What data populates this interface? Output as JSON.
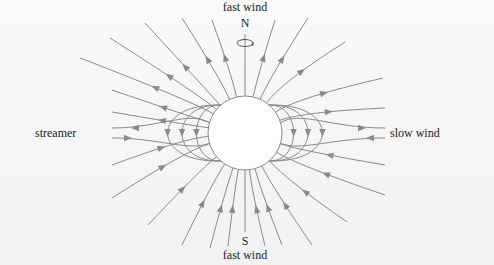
{
  "diagram": {
    "labels": {
      "top_wind": "fast wind",
      "north_pole": "N",
      "south_pole": "S",
      "bottom_wind": "fast wind",
      "left": "streamer",
      "right": "slow wind"
    },
    "icons": {
      "rotation": "rotation-arrow-icon"
    },
    "colors": {
      "field_line": "#8a8a8a",
      "sun_fill": "#ffffff",
      "sun_stroke": "#8a8a8a",
      "text": "#222222",
      "background": "#f5f5f5"
    },
    "field_lines": {
      "open_north_count": 12,
      "open_south_count": 12,
      "closed_loops_per_side": 3,
      "flow_direction_north": "outward",
      "flow_direction_south": "inward"
    }
  }
}
